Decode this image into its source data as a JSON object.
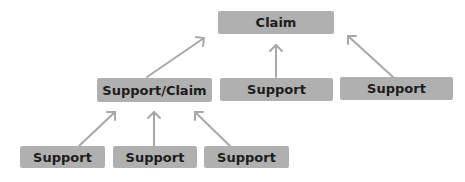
{
  "diagram": {
    "type": "argument-tree",
    "colors": {
      "box": "#b0b0b0",
      "text": "#1c1c1c",
      "arrow": "#a8a8a8",
      "background": "#ffffff"
    },
    "nodes": [
      {
        "id": "claim",
        "label": "Claim"
      },
      {
        "id": "support-claim",
        "label": "Support/Claim"
      },
      {
        "id": "support-mid",
        "label": "Support"
      },
      {
        "id": "support-right",
        "label": "Support"
      },
      {
        "id": "support-bottom-1",
        "label": "Support"
      },
      {
        "id": "support-bottom-2",
        "label": "Support"
      },
      {
        "id": "support-bottom-3",
        "label": "Support"
      }
    ],
    "edges": [
      {
        "from": "support-claim",
        "to": "claim"
      },
      {
        "from": "support-mid",
        "to": "claim"
      },
      {
        "from": "support-right",
        "to": "claim"
      },
      {
        "from": "support-bottom-1",
        "to": "support-claim"
      },
      {
        "from": "support-bottom-2",
        "to": "support-claim"
      },
      {
        "from": "support-bottom-3",
        "to": "support-claim"
      }
    ]
  }
}
